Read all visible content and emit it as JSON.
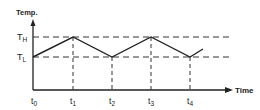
{
  "diagram": {
    "y_axis_label": "Temp.",
    "x_axis_label": "Time",
    "levels": {
      "high": {
        "main": "T",
        "sub": "H"
      },
      "low": {
        "main": "T",
        "sub": "L"
      }
    },
    "time_ticks": [
      {
        "main": "t",
        "sub": "0"
      },
      {
        "main": "t",
        "sub": "1"
      },
      {
        "main": "t",
        "sub": "2"
      },
      {
        "main": "t",
        "sub": "3"
      },
      {
        "main": "t",
        "sub": "4"
      }
    ],
    "waveform": "triangular oscillation between T_L and T_H; peaks at t1, t3; troughs at t2, t4",
    "colors": {
      "line": "#222222",
      "background": "#ffffff"
    }
  }
}
